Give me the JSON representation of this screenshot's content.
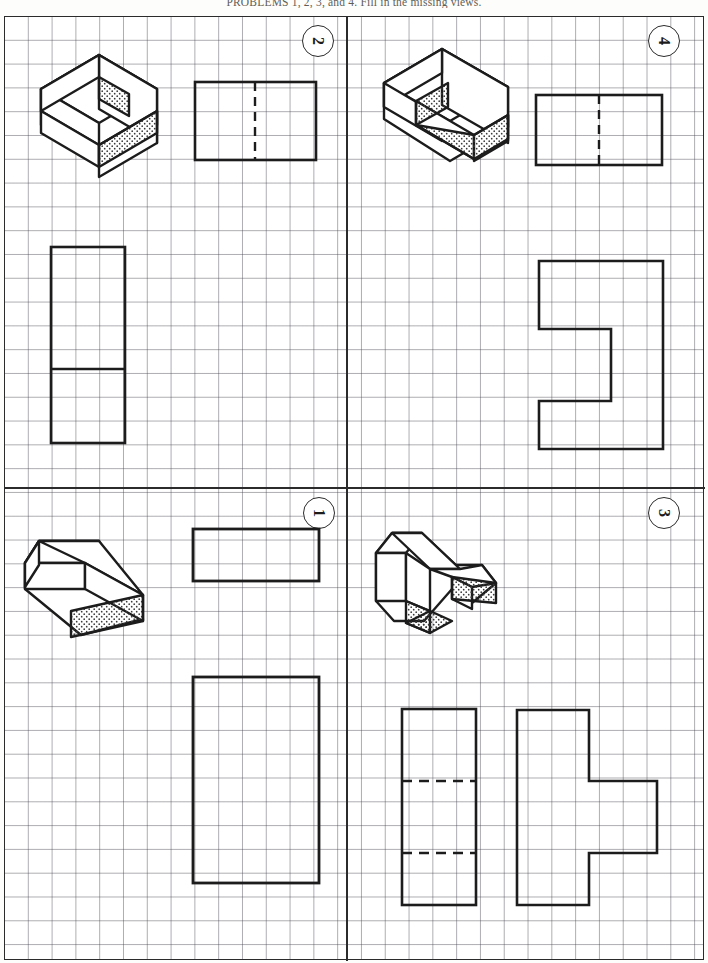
{
  "worksheet": {
    "caption": "PROBLEMS 1, 2, 3, and 4. Fill in the missing views.",
    "sheet_type": "graph-paper",
    "grid_square_px": 24,
    "layout": "2x2 quadrants",
    "line_colors": {
      "object_line": "#1c1c1c",
      "grid_line": "#8d8d96",
      "border": "#2b2b2b"
    }
  },
  "problems": [
    {
      "number": "1",
      "quadrant": "lower-left",
      "pictorial": {
        "name": "rectangular-block",
        "description": "Plain rectangular prism shown in isometric with stippled right end face",
        "shaded_faces": 1
      },
      "given_views": [
        {
          "view": "top",
          "shape": "rectangle",
          "hidden_lines": 0
        },
        {
          "view": "front",
          "shape": "rectangle",
          "hidden_lines": 0
        }
      ],
      "missing_view": "right-side"
    },
    {
      "number": "2",
      "quadrant": "upper-left",
      "pictorial": {
        "name": "stepped-L-block",
        "description": "L-shaped stepped block in isometric with two stippled end faces",
        "shaded_faces": 2
      },
      "given_views": [
        {
          "view": "top",
          "shape": "rectangle",
          "hidden_lines": 1,
          "hidden_line_orientation": "vertical"
        },
        {
          "view": "front",
          "shape": "divided-rectangle",
          "hidden_lines": 0
        }
      ],
      "missing_view": "right-side"
    },
    {
      "number": "3",
      "quadrant": "lower-right",
      "pictorial": {
        "name": "T-shaped-block",
        "description": "T-shaped block in isometric with two stippled end faces",
        "shaded_faces": 2
      },
      "given_views": [
        {
          "view": "front",
          "shape": "rectangle",
          "hidden_lines": 2,
          "hidden_line_orientation": "horizontal"
        },
        {
          "view": "right-side",
          "shape": "T-profile",
          "hidden_lines": 0
        }
      ],
      "missing_view": "top"
    },
    {
      "number": "4",
      "quadrant": "upper-right",
      "pictorial": {
        "name": "offset-step-block",
        "description": "Offset stepped block in isometric with two stippled faces",
        "shaded_faces": 2
      },
      "given_views": [
        {
          "view": "top",
          "shape": "rectangle",
          "hidden_lines": 1,
          "hidden_line_orientation": "vertical"
        },
        {
          "view": "right-side",
          "shape": "Z-step-profile",
          "hidden_lines": 0
        }
      ],
      "missing_view": "front"
    }
  ]
}
